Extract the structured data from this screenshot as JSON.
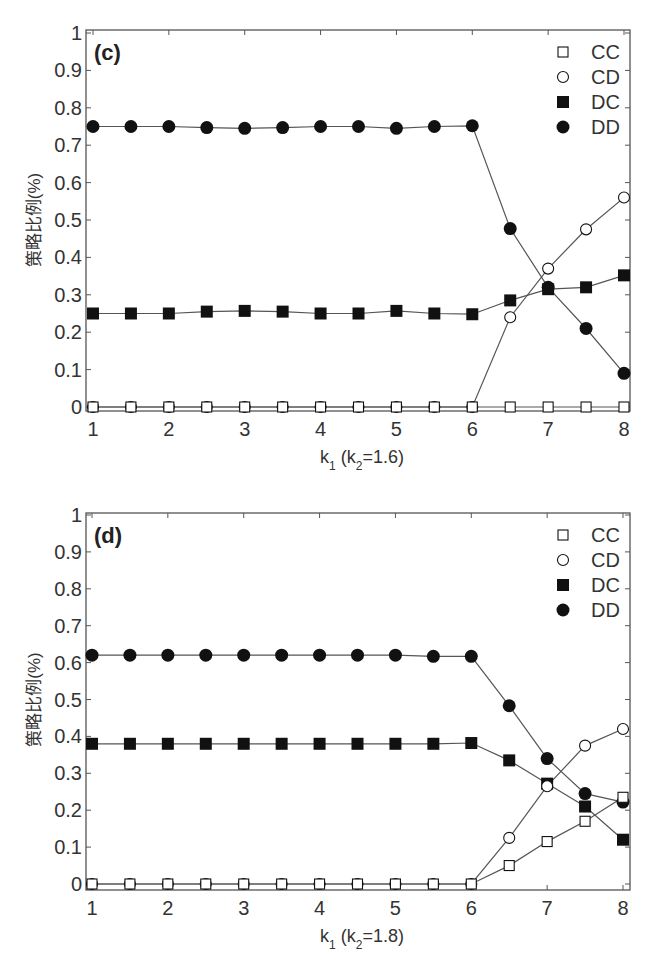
{
  "chart_data": [
    {
      "type": "line",
      "panel": "(c)",
      "title": "",
      "xlabel": "k1 (k2=1.6)",
      "ylabel": "策略比例(%)",
      "xlim": [
        1,
        8
      ],
      "ylim": [
        0,
        1
      ],
      "xticks": [
        1,
        2,
        3,
        4,
        5,
        6,
        7,
        8
      ],
      "yticks": [
        0,
        0.1,
        0.2,
        0.3,
        0.4,
        0.5,
        0.6,
        0.7,
        0.8,
        0.9,
        1
      ],
      "ytick_labels": [
        "0",
        "0.1",
        "0.2",
        "0.3",
        "0.4",
        "0.5",
        "0.6",
        "0.7",
        "0.8",
        "0.9",
        "1"
      ],
      "grid": false,
      "legend_position": "upper right",
      "x": [
        1,
        1.5,
        2,
        2.5,
        3,
        3.5,
        4,
        4.5,
        5,
        5.5,
        6,
        6.5,
        7,
        7.5,
        8
      ],
      "series": [
        {
          "name": "CC",
          "marker": "open-square",
          "values": [
            0,
            0,
            0,
            0,
            0,
            0,
            0,
            0,
            0,
            0,
            0,
            0,
            0,
            0,
            0
          ]
        },
        {
          "name": "CD",
          "marker": "open-circle",
          "values": [
            0,
            0,
            0,
            0,
            0,
            0,
            0,
            0,
            0,
            0,
            0,
            0.24,
            0.37,
            0.475,
            0.56
          ]
        },
        {
          "name": "DC",
          "marker": "filled-square",
          "values": [
            0.25,
            0.25,
            0.25,
            0.255,
            0.257,
            0.255,
            0.25,
            0.25,
            0.257,
            0.25,
            0.248,
            0.285,
            0.315,
            0.32,
            0.352
          ]
        },
        {
          "name": "DD",
          "marker": "filled-circle",
          "values": [
            0.75,
            0.75,
            0.75,
            0.747,
            0.745,
            0.747,
            0.75,
            0.75,
            0.745,
            0.75,
            0.752,
            0.477,
            0.32,
            0.21,
            0.09
          ]
        }
      ]
    },
    {
      "type": "line",
      "panel": "(d)",
      "title": "",
      "xlabel": "k1 (k2=1.8)",
      "ylabel": "策略比例(%)",
      "xlim": [
        1,
        8
      ],
      "ylim": [
        0,
        1
      ],
      "xticks": [
        1,
        2,
        3,
        4,
        5,
        6,
        7,
        8
      ],
      "yticks": [
        0,
        0.1,
        0.2,
        0.3,
        0.4,
        0.5,
        0.6,
        0.7,
        0.8,
        0.9,
        1
      ],
      "ytick_labels": [
        "0",
        "0.1",
        "0.2",
        "0.3",
        "0.4",
        "0.5",
        "0.6",
        "0.7",
        "0.8",
        "0.9",
        "1"
      ],
      "grid": false,
      "legend_position": "upper right",
      "x": [
        1,
        1.5,
        2,
        2.5,
        3,
        3.5,
        4,
        4.5,
        5,
        5.5,
        6,
        6.5,
        7,
        7.5,
        8
      ],
      "series": [
        {
          "name": "CC",
          "marker": "open-square",
          "values": [
            0,
            0,
            0,
            0,
            0,
            0,
            0,
            0,
            0,
            0,
            0,
            0.05,
            0.115,
            0.17,
            0.235
          ]
        },
        {
          "name": "CD",
          "marker": "open-circle",
          "values": [
            0,
            0,
            0,
            0,
            0,
            0,
            0,
            0,
            0,
            0,
            0,
            0.125,
            0.265,
            0.375,
            0.42
          ]
        },
        {
          "name": "DC",
          "marker": "filled-square",
          "values": [
            0.38,
            0.38,
            0.38,
            0.38,
            0.38,
            0.38,
            0.38,
            0.38,
            0.38,
            0.38,
            0.382,
            0.335,
            0.272,
            0.21,
            0.12
          ]
        },
        {
          "name": "DD",
          "marker": "filled-circle",
          "values": [
            0.62,
            0.62,
            0.62,
            0.62,
            0.62,
            0.62,
            0.62,
            0.62,
            0.62,
            0.617,
            0.617,
            0.483,
            0.34,
            0.245,
            0.222
          ]
        }
      ]
    }
  ],
  "panels": [
    {
      "tag": "(c)",
      "xlabel_main": "k",
      "xlabel_sub1": "1",
      "xlabel_mid": " (k",
      "xlabel_sub2": "2",
      "xlabel_end": "=1.6)",
      "ylabel": "策略比例(%)"
    },
    {
      "tag": "(d)",
      "xlabel_main": "k",
      "xlabel_sub1": "1",
      "xlabel_mid": " (k",
      "xlabel_sub2": "2",
      "xlabel_end": "=1.8)",
      "ylabel": "策略比例(%)"
    }
  ],
  "legend": [
    "CC",
    "CD",
    "DC",
    "DD"
  ],
  "colors": {
    "line": "#555555",
    "marker": "#111111",
    "axis": "#555555",
    "background": "#ffffff"
  }
}
